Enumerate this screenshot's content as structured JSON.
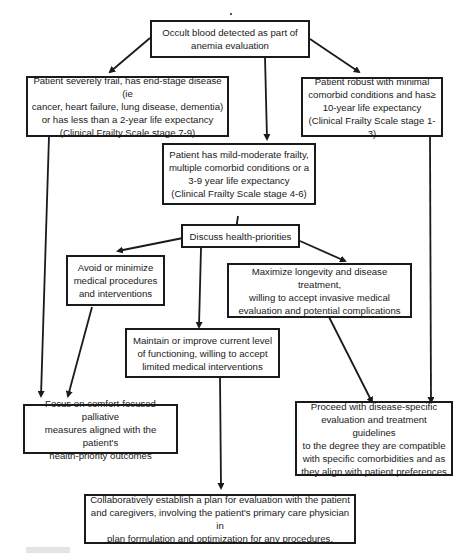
{
  "diagram": {
    "type": "flowchart",
    "nodes": {
      "start": {
        "label": "Occult blood detected as part of anemia evaluation"
      },
      "severe": {
        "label": "Patient severely frail, has end-stage disease (ie cancer, heart failure, lung disease, dementia) or has less than a 2-year life expectancy (Clinical Frailty Scale stage 7-9)"
      },
      "robust": {
        "label": "Patient robust with minimal comorbid conditions and has≥ 10-year life expectancy (Clinical Frailty Scale stage 1-3)"
      },
      "moderate": {
        "label": "Patient has mild-moderate frailty, multiple comorbid conditions or a 3-9 year life expectancy (Clinical Frailty Scale stage 4-6)"
      },
      "discuss": {
        "label": "Discuss health-priorities"
      },
      "avoid": {
        "label": "Avoid or minimize medical procedures and interventions"
      },
      "maximize": {
        "label": "Maximize longevity and disease treatment, willing to accept invasive medical evaluation and potential complications"
      },
      "maintain": {
        "label": "Maintain or improve current level of functioning, willing to accept limited medical interventions"
      },
      "comfort": {
        "label": "Focus on comfort-focused palliative measures aligned with the patient's health-priority outcomes"
      },
      "proceed": {
        "label": "Proceed with disease-specific evaluation and treatment guidelines to the degree they are compatible with specific comorbidities and as they align with patient preferences"
      },
      "collab": {
        "label": "Collaboratively establish a plan for evaluation with the patient and caregivers, involving the patient's primary care physician in plan formulation and optimization for any procedures."
      }
    },
    "lines": {
      "start": [
        "Occult blood detected as part of",
        "anemia evaluation"
      ],
      "severe": [
        "Patient severely frail, has end-stage disease (ie",
        "cancer, heart failure, lung disease, dementia)",
        "or has less than a 2-year life expectancy",
        "(Clinical Frailty Scale stage 7-9)"
      ],
      "robust": [
        "Patient robust with minimal",
        "comorbid conditions and has≥",
        "10-year life expectancy",
        "(Clinical Frailty Scale stage 1-3)"
      ],
      "moderate": [
        "Patient has mild-moderate frailty,",
        "multiple comorbid conditions or a",
        "3-9 year life expectancy",
        "(Clinical Frailty Scale stage 4-6)"
      ],
      "discuss": [
        "Discuss health-priorities"
      ],
      "avoid": [
        "Avoid or minimize",
        "medical procedures",
        "and interventions"
      ],
      "maximize": [
        "Maximize longevity and disease treatment,",
        "willing to accept invasive medical",
        "evaluation and potential complications"
      ],
      "maintain": [
        "Maintain or improve current level",
        "of functioning, willing to accept",
        "limited medical interventions"
      ],
      "comfort": [
        "Focus on comfort-focused palliative",
        "measures aligned with the patient's",
        "health-priority outcomes"
      ],
      "proceed": [
        "Proceed with disease-specific",
        "evaluation and treatment guidelines",
        "to the degree they are compatible",
        "with specific comorbidities and as",
        "they align with patient preferences"
      ],
      "collab": [
        "Collaboratively establish a plan for evaluation with the patient",
        "and caregivers, involving the patient's primary care physician in",
        "plan formulation and optimization for any procedures."
      ]
    },
    "edges": [
      [
        "start",
        "severe"
      ],
      [
        "start",
        "moderate"
      ],
      [
        "start",
        "robust"
      ],
      [
        "severe",
        "comfort"
      ],
      [
        "moderate",
        "discuss"
      ],
      [
        "discuss",
        "avoid"
      ],
      [
        "discuss",
        "maintain"
      ],
      [
        "discuss",
        "maximize"
      ],
      [
        "avoid",
        "comfort"
      ],
      [
        "maintain",
        "collab"
      ],
      [
        "maximize",
        "proceed"
      ],
      [
        "robust",
        "proceed"
      ]
    ],
    "colors": {
      "stroke": "#1a1a1a",
      "background": "#ffffff"
    }
  }
}
